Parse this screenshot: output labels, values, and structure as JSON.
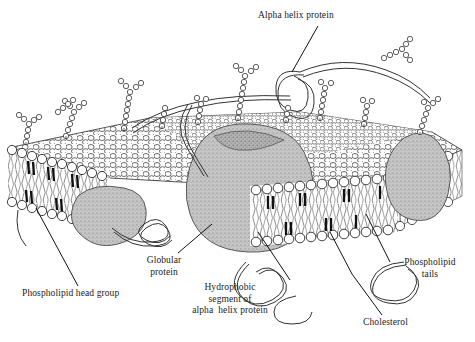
{
  "figure": {
    "background_color": "#ffffff",
    "ink_color": "#1a1a1a",
    "protein_fill_color": "#b4b4b4",
    "protein_fill_light": "#c9c9c9",
    "membrane_fill_color": "#ffffff",
    "cholesterol_color": "#1a1a1a"
  },
  "labels": {
    "alpha_helix_protein": "Alpha helix protein",
    "phospholipid_head_group": "Phospholipid head group",
    "globular_protein": "Globular\nprotein",
    "hydrophobic_segment": "Hydrophobic\nsegment of\nalpha  helix protein",
    "phospholipid_tails": "Phospholipid\ntails",
    "cholesterol": "Cholesterol"
  },
  "structures": [
    {
      "name": "phospholipid-bilayer",
      "description": "Two rows of spherical head groups enclosing wavy hydrophobic tails, drawn in perspective as a cut slab"
    },
    {
      "name": "globular-protein-left",
      "description": "Stippled gray globular protein protruding below the bilayer on the left"
    },
    {
      "name": "globular-protein-center",
      "description": "Large stippled gray globular protein spanning and bulging below the bilayer at center"
    },
    {
      "name": "globular-protein-right",
      "description": "Stippled gray transmembrane globular protein on the right edge"
    },
    {
      "name": "alpha-helix-protein-ribbon",
      "description": "Long smooth looping ribbon extending above the membrane and weaving through it"
    },
    {
      "name": "cholesterol-molecules",
      "description": "Small dark elongated oval molecules wedged between phospholipid tails"
    },
    {
      "name": "glycoprotein-chains",
      "description": "Branched beaded carbohydrate chains projecting from the outer membrane surface"
    }
  ]
}
